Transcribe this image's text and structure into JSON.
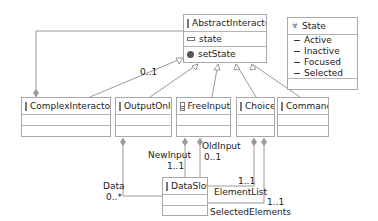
{
  "diagram": {
    "classes": {
      "abstract_interactor": {
        "name": "AbstractInteractor",
        "attributes": [
          "state"
        ],
        "operations": [
          "setState"
        ]
      },
      "state_enum": {
        "name": "State",
        "literals": [
          "Active",
          "Inactive",
          "Focused",
          "Selected"
        ]
      },
      "complex_interactor": {
        "name": "ComplexInteractor"
      },
      "output_only": {
        "name": "OutputOnly"
      },
      "free_input": {
        "name": "FreeInput"
      },
      "choice": {
        "name": "Choice"
      },
      "command": {
        "name": "Command"
      },
      "data_slot": {
        "name": "DataSlot"
      }
    },
    "labels": {
      "complex_mult": "0..1",
      "new_input_role": "NewInput",
      "new_input_mult": "1..1",
      "old_input_role": "OldInput",
      "old_input_mult": "0..1",
      "data_role": "Data",
      "data_mult": "0..*",
      "element_list_mult": "1..1",
      "element_list_role": "ElementList",
      "selected_mult": "1..1",
      "selected_role": "SelectedElements"
    },
    "colors": {
      "line": "#9a9a9a",
      "border": "#a8a8a8",
      "text": "#222222"
    }
  }
}
